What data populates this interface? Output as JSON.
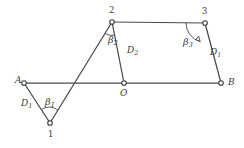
{
  "figure": {
    "background_color": "#ffffff",
    "stroke_color": "#4a4a4a",
    "text_color": "#3a3a3a",
    "nodes": [
      {
        "id": "A",
        "label": "A",
        "x": 24,
        "y": 83,
        "kind": "point"
      },
      {
        "id": "1",
        "label": "1",
        "x": 50,
        "y": 123,
        "kind": "point"
      },
      {
        "id": "2",
        "label": "2",
        "x": 112,
        "y": 22,
        "kind": "point"
      },
      {
        "id": "O",
        "label": "O",
        "x": 124,
        "y": 83,
        "kind": "point"
      },
      {
        "id": "3",
        "label": "3",
        "x": 205,
        "y": 23,
        "kind": "point"
      },
      {
        "id": "B",
        "label": "B",
        "x": 221,
        "y": 83,
        "kind": "point"
      }
    ],
    "edges": [
      {
        "from": "A",
        "to": "B",
        "note": "baseline A to B through O"
      },
      {
        "from": "A",
        "to": "1",
        "note": "link D1 left"
      },
      {
        "from": "1",
        "to": "2",
        "note": "long link crossing baseline"
      },
      {
        "from": "2",
        "to": "O",
        "note": "link D2"
      },
      {
        "from": "2",
        "to": "3",
        "note": "top horizontal link"
      },
      {
        "from": "3",
        "to": "B",
        "note": "link D1 right"
      }
    ],
    "edge_labels": [
      {
        "id": "d1-left",
        "text_main": "D",
        "text_sub": "1",
        "x": 21,
        "y": 99
      },
      {
        "id": "d2",
        "text_main": "D",
        "text_sub": "2",
        "x": 127,
        "y": 46
      },
      {
        "id": "d1-right",
        "text_main": "D",
        "text_sub": "1",
        "x": 210,
        "y": 48
      }
    ],
    "angle_labels": [
      {
        "id": "beta1",
        "text_main": "β",
        "text_sub": "1",
        "x": 45,
        "y": 97
      },
      {
        "id": "beta2",
        "text_main": "β",
        "text_sub": "2",
        "x": 108,
        "y": 35
      },
      {
        "id": "beta3",
        "text_main": "β",
        "text_sub": "3",
        "x": 183,
        "y": 37
      }
    ],
    "point_labels": [
      {
        "id": "label-A",
        "text": "A",
        "x": 15,
        "y": 76,
        "style": "italic"
      },
      {
        "id": "label-B",
        "text": "B",
        "x": 228,
        "y": 78,
        "style": "italic"
      },
      {
        "id": "label-O",
        "text": "O",
        "x": 120,
        "y": 89,
        "style": "italic"
      },
      {
        "id": "label-1",
        "text": "1",
        "x": 48,
        "y": 130,
        "style": "normal"
      },
      {
        "id": "label-2",
        "text": "2",
        "x": 109,
        "y": 6,
        "style": "normal"
      },
      {
        "id": "label-3",
        "text": "3",
        "x": 202,
        "y": 7,
        "style": "normal"
      }
    ]
  }
}
